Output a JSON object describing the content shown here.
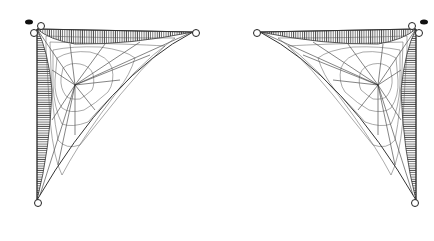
{
  "image": {
    "description": "Two mirrored spiderweb corner ornaments on white background",
    "ornaments": [
      {
        "id": "left",
        "corner": "top-left",
        "web_center": [
          75,
          85
        ]
      },
      {
        "id": "right",
        "corner": "top-right",
        "web_center": [
          378,
          86
        ]
      }
    ],
    "colors": {
      "background": "#ffffff",
      "ink": "#2a2a2a",
      "hatch": "#555555"
    }
  }
}
